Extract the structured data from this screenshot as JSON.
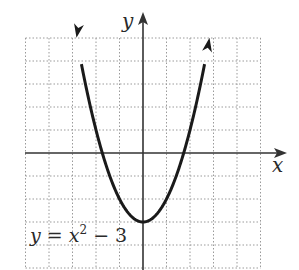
{
  "chart_data": {
    "type": "line",
    "title": "",
    "function": "y = x^2 - 3",
    "equation_label": {
      "lhs": "y = x",
      "exp": "2",
      "rhs": " − 3"
    },
    "xlabel": "x",
    "ylabel": "y",
    "xlim": [
      -5,
      5
    ],
    "ylim": [
      -5,
      5
    ],
    "grid": true,
    "grid_style": "dotted",
    "series": [
      {
        "name": "y = x^2 - 3",
        "x": [
          -2.83,
          -2.5,
          -2,
          -1.5,
          -1,
          -0.5,
          0,
          0.5,
          1,
          1.5,
          2,
          2.5,
          2.83
        ],
        "y": [
          5.0,
          3.25,
          1,
          -0.75,
          -2,
          -2.75,
          -3,
          -2.75,
          -2,
          -0.75,
          1,
          3.25,
          5.0
        ],
        "color": "#1a1a1a",
        "arrows_at_ends": true
      }
    ],
    "vertex": [
      0,
      -3
    ],
    "x_intercepts": [
      -1.73,
      1.73
    ]
  },
  "colors": {
    "curve": "#1a1a1a",
    "axis": "#333333",
    "grid": "#9a9a9a"
  }
}
